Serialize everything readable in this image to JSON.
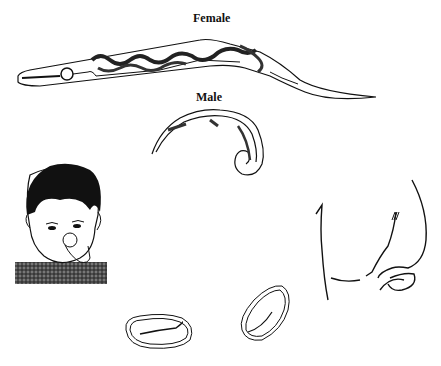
{
  "diagram": {
    "labels": {
      "female": "Female",
      "male": "Male"
    },
    "elements": [
      {
        "name": "female-worm",
        "description": "adult female worm with coiled uterus full of eggs"
      },
      {
        "name": "male-worm",
        "description": "adult male worm with curled tail"
      },
      {
        "name": "child",
        "description": "child with fingers in mouth"
      },
      {
        "name": "perianal-region",
        "description": "outline of buttocks / perianal area"
      },
      {
        "name": "egg-1",
        "description": "egg with larva"
      },
      {
        "name": "egg-2",
        "description": "egg with larva"
      }
    ],
    "colors": {
      "ink": "#111111",
      "background": "#ffffff"
    }
  }
}
